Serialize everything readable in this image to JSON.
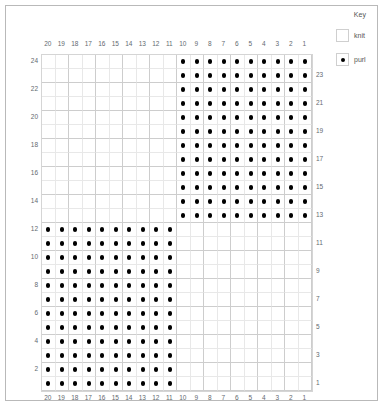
{
  "chart_data": {
    "type": "heatmap",
    "columns": 20,
    "rows": 24,
    "column_labels": [
      20,
      19,
      18,
      17,
      16,
      15,
      14,
      13,
      12,
      11,
      10,
      9,
      8,
      7,
      6,
      5,
      4,
      3,
      2,
      1
    ],
    "row_labels_left": [
      24,
      22,
      20,
      18,
      16,
      14,
      12,
      10,
      8,
      6,
      4,
      2
    ],
    "row_labels_right": [
      23,
      21,
      19,
      17,
      15,
      13,
      11,
      9,
      7,
      5,
      3,
      1
    ],
    "symbols": {
      "knit": "",
      "purl": "•"
    },
    "blocks": [
      {
        "name": "upper-right-purl-block",
        "stitch": "purl",
        "row_start": 13,
        "row_end": 24,
        "col_start": 1,
        "col_end": 10
      },
      {
        "name": "lower-left-purl-block",
        "stitch": "purl",
        "row_start": 1,
        "row_end": 12,
        "col_start": 11,
        "col_end": 20
      }
    ],
    "background_stitch": "knit",
    "xlabel": "",
    "ylabel": "",
    "grid": true,
    "legend_position": "top-right"
  },
  "key": {
    "title": "Key",
    "entries": [
      {
        "label": "knit",
        "symbol": ""
      },
      {
        "label": "purl",
        "symbol": "•"
      }
    ]
  },
  "colors": {
    "dot": "#000000",
    "grid_minor": "#e8e8e8",
    "grid_major": "#cdcdcd",
    "frame": "#b9b9b9",
    "label_text": "#63696f",
    "key_text": "#555555"
  }
}
